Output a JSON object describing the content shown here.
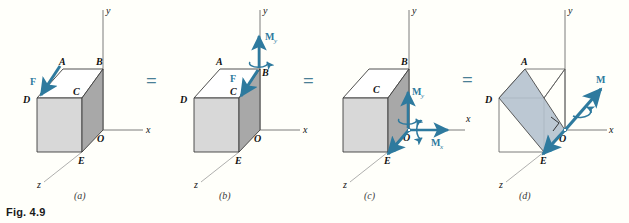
{
  "figure": {
    "caption": "Fig. 4.9",
    "background": "#fffffa",
    "accent_color": "#2e7a9e",
    "equals_color": "#4a7f96",
    "face_front": "#d8d8d8",
    "face_side": "#a8a8a8",
    "face_top": "#ffffff",
    "plane_shade": "#b6c3cf",
    "outline_color": "#3d3d3d",
    "axis_color": "#6e6e6e",
    "label_color": "#111111"
  },
  "operators": [
    {
      "symbol": "=",
      "x": 153,
      "y": 82
    },
    {
      "symbol": "=",
      "x": 310,
      "y": 82
    },
    {
      "symbol": "=",
      "x": 469,
      "y": 81
    }
  ],
  "panels": [
    {
      "id": "a",
      "label": "(a)",
      "label_x": 80,
      "label_y": 196,
      "axes": [
        {
          "name": "y-axis",
          "label": "y"
        },
        {
          "name": "x-axis",
          "label": "x"
        },
        {
          "name": "z-axis",
          "label": "z"
        }
      ],
      "vertices": [
        "A",
        "B",
        "C",
        "D",
        "O",
        "E"
      ],
      "vectors": [
        {
          "name": "F",
          "label": "F",
          "type": "force",
          "applied_at": "A",
          "direction": "down-left"
        }
      ]
    },
    {
      "id": "b",
      "label": "(b)",
      "label_x": 225,
      "label_y": 196,
      "axes": [
        {
          "name": "y-axis",
          "label": "y"
        },
        {
          "name": "x-axis",
          "label": "x"
        },
        {
          "name": "z-axis",
          "label": "z"
        }
      ],
      "vertices": [
        "A",
        "B",
        "C",
        "D",
        "O",
        "E"
      ],
      "vectors": [
        {
          "name": "F",
          "label": "F",
          "type": "force",
          "applied_at": "B",
          "direction": "down-left"
        },
        {
          "name": "My",
          "label": "M",
          "subscript": "y",
          "type": "couple",
          "applied_at": "B",
          "direction": "up-along-y"
        }
      ]
    },
    {
      "id": "c",
      "label": "(c)",
      "label_x": 370,
      "label_y": 196,
      "axes": [
        {
          "name": "y-axis",
          "label": "y"
        },
        {
          "name": "x-axis",
          "label": "x"
        },
        {
          "name": "z-axis",
          "label": "z"
        }
      ],
      "vertices": [
        "B",
        "C",
        "O",
        "E"
      ],
      "vectors": [
        {
          "name": "F",
          "label": "F",
          "type": "force",
          "applied_at": "O",
          "direction": "down-left"
        },
        {
          "name": "My",
          "label": "M",
          "subscript": "y",
          "type": "couple",
          "applied_at": "O",
          "direction": "up-along-y"
        },
        {
          "name": "Mx",
          "label": "M",
          "subscript": "x",
          "type": "couple",
          "applied_at": "O",
          "direction": "right-along-x"
        }
      ]
    },
    {
      "id": "d",
      "label": "(d)",
      "label_x": 525,
      "label_y": 196,
      "axes": [
        {
          "name": "y-axis",
          "label": "y"
        },
        {
          "name": "x-axis",
          "label": "x"
        },
        {
          "name": "z-axis",
          "label": "z"
        }
      ],
      "vertices": [
        "A",
        "D",
        "O",
        "E"
      ],
      "shaded_plane": "A-D-E-O diagonal plane",
      "right_angle_mark": true,
      "vectors": [
        {
          "name": "F",
          "label": "F",
          "type": "force",
          "applied_at": "O",
          "direction": "down-left"
        },
        {
          "name": "M",
          "label": "M",
          "type": "couple",
          "applied_at": "O",
          "direction": "up-right-perpendicular-to-F"
        }
      ]
    }
  ]
}
